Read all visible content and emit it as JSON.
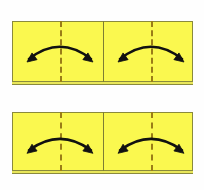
{
  "figure": {
    "background_color": "#fefefe",
    "width": 204,
    "height": 190,
    "paper_fill": "#faf84f",
    "paper_border": "#8a8a3c",
    "paper_edge_fill": "#e8e65a",
    "crease_color": "#9a7d17",
    "seam_color": "#7d7d33",
    "arrow_color": "#111111"
  },
  "panels": [
    {
      "id": "top-panel",
      "label": "top-step",
      "x": 12,
      "y": 21,
      "width": 181,
      "height": 61,
      "seam_x_pct": 50,
      "creases": [
        {
          "label": "left-crease",
          "x_pct": 26.5
        },
        {
          "label": "right-crease",
          "x_pct": 76.8
        }
      ],
      "arrows": [
        {
          "label": "left-fold-arrow",
          "type": "double-headed-arc",
          "direction": "outward",
          "cx_pct": 26.5,
          "cy_pct": 52,
          "span": 62,
          "rise": 14
        },
        {
          "label": "right-fold-arrow",
          "type": "double-headed-arc",
          "direction": "outward",
          "cx_pct": 76.8,
          "cy_pct": 52,
          "span": 62,
          "rise": 14
        }
      ]
    },
    {
      "id": "bottom-panel",
      "label": "bottom-step",
      "x": 12,
      "y": 112,
      "width": 181,
      "height": 59,
      "seam_x_pct": 50,
      "creases": [
        {
          "label": "left-crease",
          "x_pct": 26.5
        },
        {
          "label": "right-crease",
          "x_pct": 76.8
        }
      ],
      "arrows": [
        {
          "label": "left-fold-arrow",
          "type": "double-headed-arc",
          "direction": "outward",
          "cx_pct": 26.5,
          "cy_pct": 55,
          "span": 62,
          "rise": 13
        },
        {
          "label": "right-fold-arrow",
          "type": "double-headed-arc",
          "direction": "outward",
          "cx_pct": 76.8,
          "cy_pct": 55,
          "span": 62,
          "rise": 13
        }
      ]
    }
  ]
}
